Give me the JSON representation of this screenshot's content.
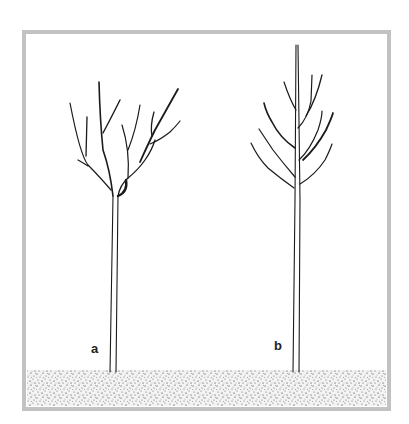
{
  "figure": {
    "frame_color": "#c2c2c2",
    "ink_color": "#1a1a1a",
    "ground_color": "#f2f2f2",
    "trees": [
      {
        "id": "a",
        "label": "a",
        "form": "open-centre / vase-shaped crown with several spreading branches"
      },
      {
        "id": "b",
        "label": "b",
        "form": "central-leader crown with a tall upright leader and tiered side branches"
      }
    ]
  }
}
